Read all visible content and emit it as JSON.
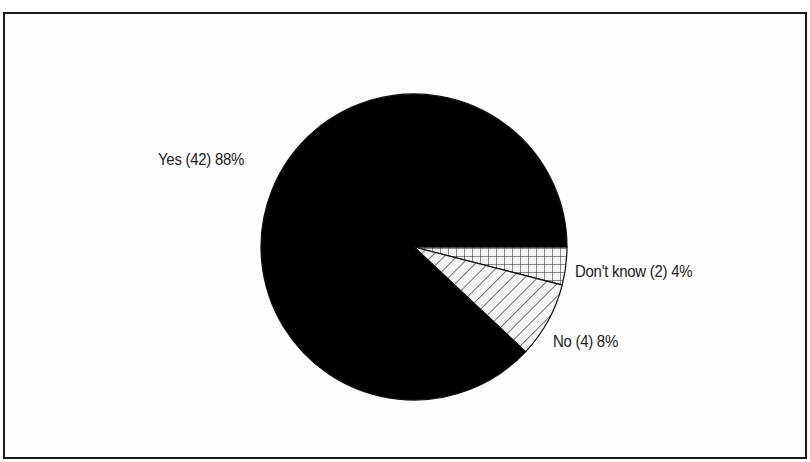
{
  "chart_data": {
    "type": "pie",
    "title": "",
    "start_angle_deg": 0,
    "direction": "clockwise",
    "slices": [
      {
        "name": "Don't know",
        "count": 2,
        "percent": 4,
        "label": "Don't know (2) 4%",
        "fill": "crosshatch"
      },
      {
        "name": "No",
        "count": 4,
        "percent": 8,
        "label": "No (4) 8%",
        "fill": "diagonal-hatch"
      },
      {
        "name": "Yes",
        "count": 42,
        "percent": 88,
        "label": "Yes (42) 88%",
        "fill": "#000000"
      }
    ],
    "categories": [
      "Don't know",
      "No",
      "Yes"
    ],
    "values": [
      2,
      4,
      42
    ],
    "legend": "none (inline labels)"
  },
  "labels": {
    "yes": "Yes (42) 88%",
    "no": "No (4) 8%",
    "dont_know": "Don't know (2) 4%"
  },
  "colors": {
    "yes": "#000000",
    "hatch": "#222222",
    "frame": "#1a1a1a",
    "background": "#ffffff"
  }
}
